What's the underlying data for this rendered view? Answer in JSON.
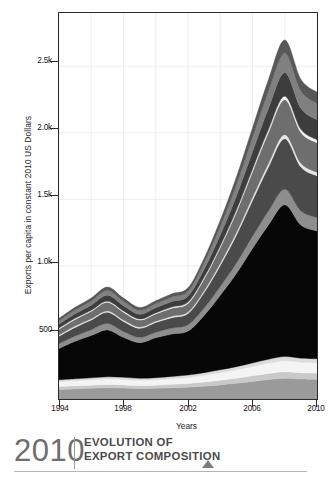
{
  "caption": {
    "year": "2010",
    "title_line1": "EVOLUTION OF",
    "title_line2": "EXPORT COMPOSITION",
    "marker": "triangle-up-icon"
  },
  "chart_data": {
    "type": "area",
    "title": "EVOLUTION OF EXPORT COMPOSITION",
    "xlabel": "Years",
    "ylabel": "Exports per capita in constant 2010 US Dollars",
    "xlim": [
      1994,
      2010
    ],
    "ylim": [
      0,
      2900
    ],
    "grid": true,
    "legend": "none",
    "stacked": true,
    "xticks": [
      1994,
      1998,
      2002,
      2006,
      2010
    ],
    "xtick_labels": [
      "1994",
      "1998",
      "2002",
      "2006",
      "2010"
    ],
    "xminor_ticks": [
      1996,
      2000,
      2004,
      2008
    ],
    "yticks": [
      500,
      1000,
      1500,
      2000,
      2500
    ],
    "ytick_labels": [
      "500",
      "1.0k",
      "1.5k",
      "2.0k",
      "2.5k"
    ],
    "x": [
      1994,
      1995,
      1996,
      1997,
      1998,
      1999,
      2000,
      2001,
      2002,
      2003,
      2004,
      2005,
      2006,
      2007,
      2008,
      2009,
      2010
    ],
    "series": [
      {
        "name": "layer-1-base-gray",
        "color": "#9a9a9a",
        "values": [
          72,
          76,
          80,
          84,
          82,
          78,
          80,
          84,
          88,
          96,
          106,
          118,
          132,
          146,
          156,
          150,
          148
        ]
      },
      {
        "name": "layer-2-light-gray",
        "color": "#c9c9c9",
        "values": [
          22,
          23,
          24,
          25,
          24,
          23,
          24,
          26,
          28,
          31,
          34,
          38,
          42,
          46,
          49,
          47,
          46
        ]
      },
      {
        "name": "layer-3-white",
        "color": "#f4f4f4",
        "values": [
          36,
          38,
          40,
          42,
          41,
          39,
          40,
          43,
          46,
          51,
          57,
          63,
          70,
          77,
          82,
          79,
          78
        ]
      },
      {
        "name": "layer-4-pale",
        "color": "#dcdcdc",
        "values": [
          14,
          15,
          15,
          16,
          16,
          15,
          16,
          17,
          18,
          20,
          22,
          24,
          27,
          30,
          32,
          31,
          30
        ]
      },
      {
        "name": "layer-5-black-dominant",
        "color": "#070707",
        "values": [
          236,
          282,
          318,
          352,
          300,
          268,
          300,
          318,
          330,
          430,
          560,
          700,
          860,
          1010,
          1140,
          1000,
          960
        ]
      },
      {
        "name": "layer-6-mid-gray",
        "color": "#8e8e8e",
        "values": [
          36,
          40,
          44,
          48,
          44,
          40,
          42,
          45,
          48,
          56,
          66,
          78,
          92,
          106,
          116,
          106,
          102
        ]
      },
      {
        "name": "layer-7-dark-gray",
        "color": "#4a4a4a",
        "values": [
          56,
          64,
          72,
          84,
          76,
          68,
          72,
          78,
          84,
          116,
          158,
          210,
          268,
          330,
          380,
          330,
          312
        ]
      },
      {
        "name": "layer-8-hairline-light",
        "color": "#e6e6e6",
        "values": [
          9,
          10,
          10,
          11,
          11,
          10,
          10,
          11,
          12,
          14,
          17,
          20,
          24,
          28,
          31,
          28,
          27
        ]
      },
      {
        "name": "layer-9-steel-gray",
        "color": "#6e6e6e",
        "values": [
          44,
          50,
          56,
          64,
          58,
          52,
          55,
          60,
          64,
          88,
          118,
          152,
          192,
          232,
          262,
          232,
          222
        ]
      },
      {
        "name": "layer-10-hairline-white",
        "color": "#f0f0f0",
        "values": [
          7,
          8,
          8,
          9,
          9,
          8,
          8,
          9,
          10,
          12,
          14,
          17,
          20,
          23,
          26,
          23,
          22
        ]
      },
      {
        "name": "layer-11-charcoal",
        "color": "#3d3d3d",
        "values": [
          30,
          34,
          38,
          44,
          40,
          36,
          38,
          41,
          44,
          60,
          80,
          104,
          130,
          158,
          178,
          158,
          150
        ]
      },
      {
        "name": "layer-12-medium-gray",
        "color": "#808080",
        "values": [
          26,
          29,
          32,
          37,
          34,
          30,
          32,
          35,
          37,
          50,
          66,
          86,
          108,
          130,
          146,
          130,
          124
        ]
      },
      {
        "name": "layer-13-top-dark",
        "color": "#585858",
        "values": [
          18,
          20,
          22,
          25,
          23,
          21,
          22,
          24,
          26,
          34,
          45,
          58,
          73,
          88,
          99,
          88,
          84
        ]
      }
    ]
  }
}
